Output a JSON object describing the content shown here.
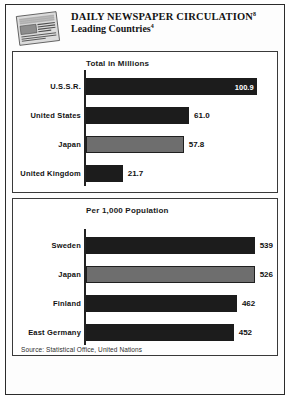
{
  "header": {
    "title": "DAILY NEWSPAPER CIRCULATION",
    "title_superscript": "8",
    "subtitle": "Leading Countries",
    "subtitle_superscript": "4",
    "masthead_icon": "newspaper-icon"
  },
  "footer": {
    "source": "Source: Statistical Office, United Nations"
  },
  "panels": [
    {
      "axis_label": "Total in Millions"
    },
    {
      "axis_label": "Per 1,000 Population"
    }
  ],
  "chart_data": [
    {
      "type": "bar",
      "orientation": "horizontal",
      "title": "DAILY NEWSPAPER CIRCULATION — Leading Countries",
      "subtitle": "Total in Millions",
      "xlabel": "Total in Millions",
      "ylabel": "",
      "xlim": [
        0,
        110
      ],
      "grid": false,
      "legend": "none",
      "categories": [
        "U.S.S.R.",
        "United States",
        "Japan",
        "United Kingdom"
      ],
      "values": [
        100.9,
        61.0,
        57.8,
        21.7
      ],
      "value_labels": [
        "100.9",
        "61.0",
        "57.8",
        "21.7"
      ],
      "label_positions": [
        "inside",
        "outside",
        "outside",
        "outside"
      ],
      "bar_colors": [
        "#1c1c1c",
        "#1c1c1c",
        "#6e6e6e",
        "#1c1c1c"
      ]
    },
    {
      "type": "bar",
      "orientation": "horizontal",
      "title": "DAILY NEWSPAPER CIRCULATION — Leading Countries",
      "subtitle": "Per 1,000 Population",
      "xlabel": "Per 1,000 Population",
      "ylabel": "",
      "xlim": [
        0,
        600
      ],
      "grid": false,
      "legend": "none",
      "categories": [
        "Sweden",
        "Japan",
        "Finland",
        "East Germany"
      ],
      "values": [
        539,
        526,
        462,
        452
      ],
      "value_labels": [
        "539",
        "526",
        "462",
        "452"
      ],
      "label_positions": [
        "outside",
        "outside",
        "outside",
        "outside"
      ],
      "bar_colors": [
        "#1c1c1c",
        "#6e6e6e",
        "#1c1c1c",
        "#1c1c1c"
      ]
    }
  ]
}
